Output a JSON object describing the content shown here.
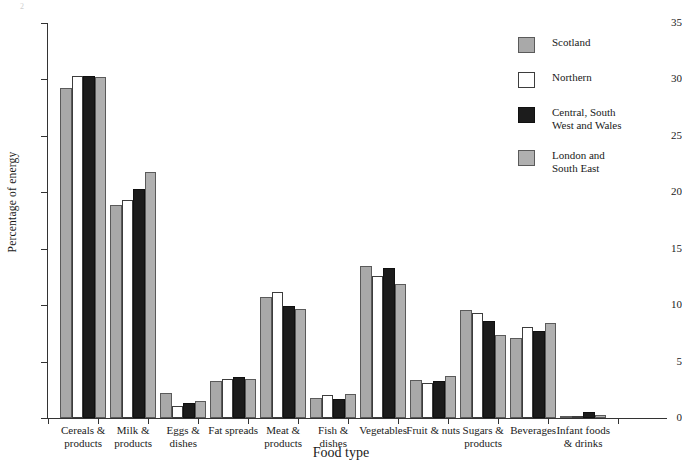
{
  "chart_data": {
    "type": "bar",
    "title": "",
    "xlabel": "Food type",
    "ylabel": "Percentage of energy",
    "ylim": [
      0,
      35
    ],
    "ytick_step": 5,
    "yticks": [
      0,
      5,
      10,
      15,
      20,
      25,
      30,
      35
    ],
    "grid": false,
    "legend_position": "right-top",
    "categories": [
      "Cereals &\nproducts",
      "Milk &\nproducts",
      "Eggs &\ndishes",
      "Fat spreads",
      "Meat &\nproducts",
      "Fish &\ndishes",
      "Vegetables",
      "Fruit & nuts",
      "Sugars &\nproducts",
      "Beverages",
      "Infant foods\n& drinks"
    ],
    "series": [
      {
        "name": "Scotland",
        "color": "#a9a9a9",
        "values": [
          29.2,
          18.9,
          2.2,
          3.3,
          10.7,
          1.8,
          13.5,
          3.4,
          9.6,
          7.1,
          0.2
        ]
      },
      {
        "name": "Northern",
        "color": "#ffffff",
        "values": [
          30.3,
          19.3,
          1.1,
          3.5,
          11.2,
          2.0,
          12.6,
          3.1,
          9.3,
          8.1,
          0.2
        ]
      },
      {
        "name": "Central, South\nWest and Wales",
        "color": "#1c1c1c",
        "values": [
          30.3,
          20.3,
          1.3,
          3.6,
          9.9,
          1.7,
          13.3,
          3.3,
          8.6,
          7.7,
          0.5
        ]
      },
      {
        "name": "London and\nSouth East",
        "color": "#b0b0b0",
        "values": [
          30.2,
          21.8,
          1.5,
          3.5,
          9.7,
          2.1,
          11.9,
          3.7,
          7.4,
          8.4,
          0.3
        ]
      }
    ]
  },
  "legend": {
    "items": [
      {
        "label": "Scotland",
        "swatch": "gray"
      },
      {
        "label": "Northern",
        "swatch": "white"
      },
      {
        "label": "Central, South\nWest and Wales",
        "swatch": "black"
      },
      {
        "label": "London and\nSouth East",
        "swatch": "light-gray"
      }
    ]
  },
  "axes": {
    "y_label": "Percentage of energy",
    "x_label": "Food type",
    "y_tick_labels": [
      "35",
      "30",
      "25",
      "20",
      "15",
      "10",
      "5",
      "0"
    ]
  },
  "corner": {
    "mark": "2"
  }
}
